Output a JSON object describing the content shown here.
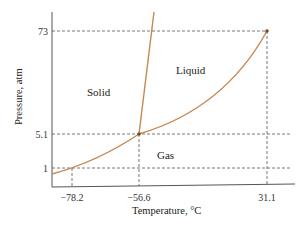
{
  "chart_data": {
    "type": "line",
    "title": "",
    "xlabel": "Temperature, °C",
    "ylabel": "Pressure, atm",
    "x_ticks": [
      {
        "value": -78.2,
        "label": "−78.2"
      },
      {
        "value": -56.6,
        "label": "−56.6"
      },
      {
        "value": 31.1,
        "label": "31.1"
      }
    ],
    "y_ticks": [
      {
        "value": 1,
        "label": "1"
      },
      {
        "value": 5.1,
        "label": "5.1"
      },
      {
        "value": 73,
        "label": "73"
      }
    ],
    "axis_scale": "non-linear (schematic)",
    "grid": false,
    "regions": [
      {
        "name": "solid",
        "label": "Solid"
      },
      {
        "name": "liquid",
        "label": "Liquid"
      },
      {
        "name": "gas",
        "label": "Gas"
      }
    ],
    "series": [
      {
        "name": "sublimation-curve",
        "points": [
          {
            "x": -78.2,
            "y": 1
          },
          {
            "x": -56.6,
            "y": 5.1
          }
        ]
      },
      {
        "name": "vaporization-curve",
        "points": [
          {
            "x": -56.6,
            "y": 5.1
          },
          {
            "x": 31.1,
            "y": 73
          }
        ]
      },
      {
        "name": "melting-curve",
        "points": [
          {
            "x": -56.6,
            "y": 5.1
          }
        ]
      }
    ],
    "key_points": [
      {
        "name": "triple-point",
        "x": -56.6,
        "y": 5.1
      },
      {
        "name": "critical-point",
        "x": 31.1,
        "y": 73
      },
      {
        "name": "normal-sublimation-point",
        "x": -78.2,
        "y": 1
      }
    ],
    "colors": {
      "curve": "#c8874f",
      "point": "#7a4a22",
      "axis": "#555555"
    }
  }
}
